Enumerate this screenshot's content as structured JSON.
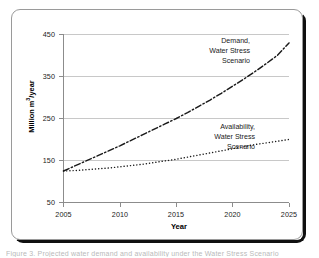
{
  "figure": {
    "caption_sliver": "Figure 3. Projected water demand and availability under the Water Stress Scenario"
  },
  "chart_data": {
    "type": "line",
    "title": "",
    "xlabel": "Year",
    "ylabel": "Million m3/year",
    "ylabel_prefix": "Million m",
    "ylabel_sup": "3",
    "ylabel_suffix": "/year",
    "xlim": [
      2005,
      2025
    ],
    "ylim": [
      50,
      450
    ],
    "grid": "horizontal",
    "legend": "annotations",
    "xticks": [
      "2005",
      "2010",
      "2015",
      "2020",
      "2025"
    ],
    "yticks": [
      "50",
      "150",
      "250",
      "350",
      "450"
    ],
    "x": [
      2005,
      2006,
      2007,
      2008,
      2009,
      2010,
      2011,
      2012,
      2013,
      2014,
      2015,
      2016,
      2017,
      2018,
      2019,
      2020,
      2021,
      2022,
      2023,
      2024,
      2025
    ],
    "series": [
      {
        "name": "Demand, Water Stress Scenario",
        "style": "dash-dot",
        "color": "#1a1a1a",
        "annotation_lines": [
          "Demand,",
          "Water Stress",
          "Scenario"
        ],
        "values": [
          125,
          137,
          149,
          161,
          173,
          185,
          198,
          211,
          224,
          237,
          250,
          264,
          279,
          294,
          310,
          327,
          344,
          362,
          381,
          401,
          430
        ]
      },
      {
        "name": "Availability, Water Stress Scenario",
        "style": "dotted",
        "color": "#1a1a1a",
        "annotation_lines": [
          "Availability,",
          "Water Stress",
          "Scenario"
        ],
        "values": [
          125,
          126,
          128,
          130,
          132,
          135,
          138,
          141,
          145,
          149,
          153,
          158,
          163,
          168,
          173,
          178,
          183,
          188,
          192,
          196,
          200
        ]
      }
    ]
  },
  "colors": {
    "axis": "#8c8c8c",
    "grid": "#c8c8c8",
    "line": "#1a1a1a",
    "frame": "#9a9a9a",
    "shadow": "#101010",
    "text": "#1a1a1a"
  }
}
